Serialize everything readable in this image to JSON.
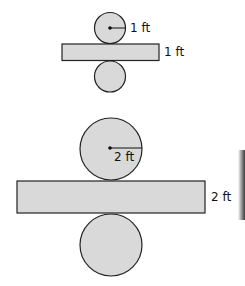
{
  "diagram": {
    "type": "cylinder-nets",
    "small_net": {
      "radius_label": "1 ft",
      "height_label": "1 ft"
    },
    "large_net": {
      "radius_label": "2 ft",
      "height_label": "2 ft"
    },
    "colors": {
      "fill": "#d9d9d9",
      "stroke": "#222222",
      "edge_shadow": "#555555"
    }
  }
}
